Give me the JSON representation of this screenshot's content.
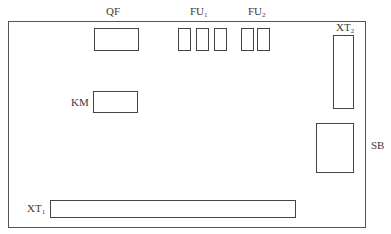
{
  "diagram": {
    "type": "control panel component layout",
    "board": {
      "name": "mounting-board"
    },
    "components": {
      "QF": {
        "label": "QF",
        "sub": "",
        "count": 1
      },
      "FU1": {
        "label": "FU",
        "sub": "1",
        "count": 3
      },
      "FU2": {
        "label": "FU",
        "sub": "2",
        "count": 2
      },
      "XT2": {
        "label": "XT",
        "sub": "2",
        "count": 1
      },
      "KM": {
        "label": "KM",
        "sub": "",
        "count": 1
      },
      "SB": {
        "label": "SB",
        "sub": "",
        "count": 1
      },
      "XT1": {
        "label": "XT",
        "sub": "1",
        "count": 1
      }
    }
  }
}
